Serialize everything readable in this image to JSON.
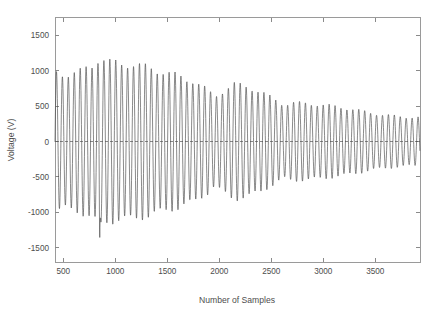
{
  "chart_data": {
    "type": "line",
    "title": "",
    "subtitle": "",
    "xlabel": "Number of Samples",
    "ylabel": "Voltage (V)",
    "xlim": [
      420,
      3930
    ],
    "ylim": [
      -1700,
      1750
    ],
    "xticks": [
      500,
      1000,
      1500,
      2000,
      2500,
      3000,
      3500
    ],
    "xticklabels": [
      "500",
      "1000",
      "1500",
      "2000",
      "2500",
      "3000",
      "3500"
    ],
    "yticks": [
      -1500,
      -1000,
      -500,
      0,
      500,
      1000,
      1500
    ],
    "yticklabels": [
      "-1500",
      "-1000",
      "-500",
      "0",
      "500",
      "1000",
      "1500"
    ],
    "grid": false,
    "legend": null,
    "legend_position": "none",
    "line_color": "#4a4a4a",
    "axes_color": "#9a9a9a",
    "background_color": "#ffffff",
    "series": [
      {
        "name": "Voltage",
        "envelope_note": "Peak amplitude starts near 1000 V, rises to about 1180 V near sample 850, decays to roughly 620 V near sample 1950, recovers to about 780 V near sample 2150, then decays steadily to about 340 V by sample 3900. One isolated negative spike reaches about -1400 V near sample 850.",
        "envelope_x": [
          420,
          520,
          650,
          780,
          850,
          920,
          1050,
          1180,
          1300,
          1450,
          1600,
          1750,
          1900,
          1950,
          2050,
          2150,
          2280,
          2400,
          2550,
          2620,
          2700,
          2850,
          3000,
          3150,
          3300,
          3450,
          3600,
          3750,
          3900
        ],
        "envelope_y": [
          1000,
          980,
          1010,
          1080,
          1180,
          1100,
          1060,
          1050,
          1040,
          1010,
          960,
          870,
          700,
          620,
          700,
          780,
          760,
          700,
          600,
          540,
          560,
          540,
          500,
          470,
          440,
          410,
          385,
          360,
          340
        ],
        "carrier_period_samples": 57,
        "spike": {
          "x": 850,
          "y": -1400
        }
      }
    ]
  },
  "figure": {
    "ylabel": "Voltage (V)",
    "xlabel": "Number of Samples"
  }
}
